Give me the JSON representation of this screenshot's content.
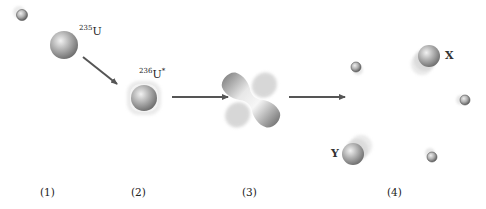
{
  "diagram": {
    "stage_labels": [
      "(1)",
      "(2)",
      "(3)",
      "(4)"
    ],
    "nuclei": {
      "u235": {
        "mass_number": "235",
        "symbol": "U",
        "suffix": ""
      },
      "u236": {
        "mass_number": "236",
        "symbol": "U",
        "suffix": "*"
      }
    },
    "fragments": {
      "x": "X",
      "y": "Y"
    },
    "colors": {
      "nucleus_light": "#e6e6e6",
      "nucleus_mid": "#a8a8a8",
      "nucleus_dark": "#6e6e6e",
      "arrow": "#555555",
      "text": "#222222"
    }
  }
}
